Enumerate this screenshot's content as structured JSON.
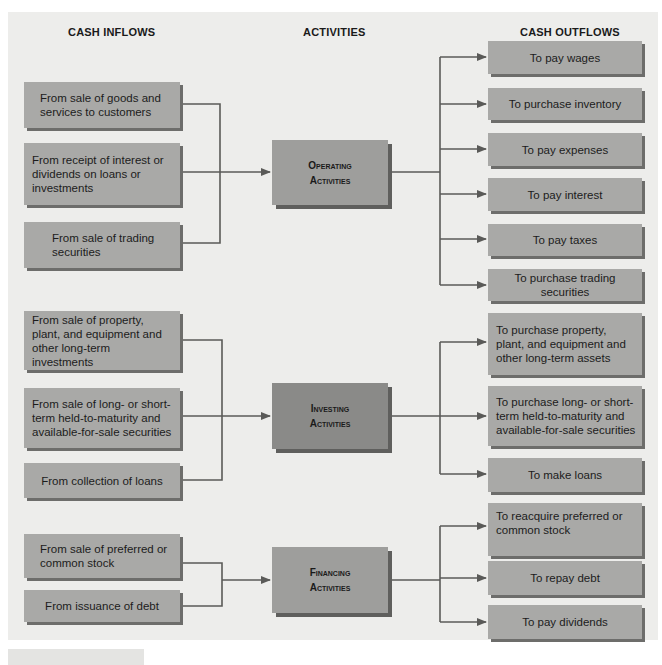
{
  "headers": {
    "inflows": "CASH INFLOWS",
    "activities": "ACTIVITIES",
    "outflows": "CASH OUTFLOWS"
  },
  "colors": {
    "background": "#ededeb",
    "box_fill": "#a9a9a7",
    "box_shadow": "#6d6d6b",
    "investing_fill": "#8a8a88",
    "connector": "#5a5a58"
  },
  "operating": {
    "title_line1": "Operating",
    "title_line2": "Activities",
    "inflows": [
      "From sale of goods and services to customers",
      "From receipt of interest or dividends on loans or investments",
      "From sale of trading securities"
    ],
    "outflows": [
      "To pay wages",
      "To purchase inventory",
      "To pay expenses",
      "To pay interest",
      "To pay taxes",
      "To purchase trading securities"
    ]
  },
  "investing": {
    "title_line1": "Investing",
    "title_line2": "Activities",
    "inflows": [
      "From sale of property, plant, and equipment and other long-term investments",
      "From sale of long- or short-term held-to-maturity and available-for-sale securities",
      "From collection of loans"
    ],
    "outflows": [
      "To purchase property, plant, and equipment and other long-term assets",
      "To purchase long- or short-term held-to-maturity and available-for-sale securities",
      "To make loans"
    ]
  },
  "financing": {
    "title_line1": "Financing",
    "title_line2": "Activities",
    "inflows": [
      "From sale of preferred or common stock",
      "From issuance of debt"
    ],
    "outflows": [
      "To reacquire preferred or common stock",
      "To repay debt",
      "To pay dividends"
    ]
  }
}
